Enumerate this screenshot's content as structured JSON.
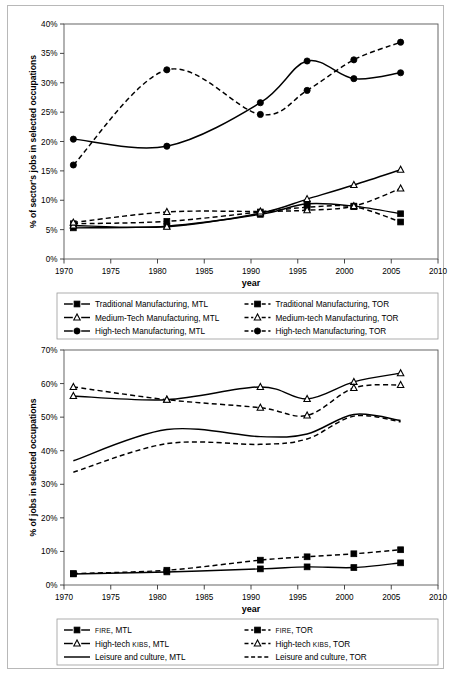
{
  "figure": {
    "background": "#ffffff",
    "border_color": "#b8b8b8"
  },
  "chart_data": [
    {
      "id": "manufacturing",
      "type": "line",
      "title": "",
      "xlabel": "year",
      "ylabel": "% of sector's jobs in selected occupations",
      "xlim": [
        1970,
        2010
      ],
      "ylim": [
        0,
        40
      ],
      "xticks": [
        "1970",
        "1975",
        "1980",
        "1985",
        "1990",
        "1995",
        "2000",
        "2005",
        "2010"
      ],
      "yticks": [
        "0%",
        "5%",
        "10%",
        "15%",
        "20%",
        "25%",
        "30%",
        "35%",
        "40%"
      ],
      "grid": false,
      "legend_position": "below",
      "x": [
        1971,
        1981,
        1991,
        1996,
        2001,
        2006
      ],
      "series": [
        {
          "name": "Traditional Manufacturing, MTL",
          "style": "solid",
          "marker": "square-filled",
          "values": [
            5.3,
            5.6,
            7.6,
            9.4,
            9.0,
            7.7
          ]
        },
        {
          "name": "Traditional Manufacturing, TOR",
          "style": "dashed",
          "marker": "square-filled",
          "values": [
            6.0,
            6.4,
            8.0,
            8.8,
            8.9,
            6.3
          ]
        },
        {
          "name": "Medium-Tech Manufacturing, MTL",
          "style": "solid",
          "marker": "triangle-open",
          "values": [
            5.7,
            5.5,
            7.8,
            10.2,
            12.6,
            15.2
          ]
        },
        {
          "name": "Medium-tech Manufacturing, TOR",
          "style": "dashed",
          "marker": "triangle-open",
          "values": [
            6.2,
            8.0,
            8.1,
            8.3,
            9.0,
            12.0
          ]
        },
        {
          "name": "High-tech Manufacturing, MTL",
          "style": "solid",
          "marker": "circle-filled",
          "values": [
            20.4,
            19.2,
            26.6,
            33.7,
            30.7,
            31.7
          ]
        },
        {
          "name": "High-tech Manufacturing, TOR",
          "style": "dashed",
          "marker": "circle-filled",
          "values": [
            16.0,
            32.2,
            24.6,
            28.7,
            33.9,
            36.9
          ]
        }
      ],
      "legend": [
        "Traditional Manufacturing, MTL",
        "Traditional Manufacturing, TOR",
        "Medium-Tech Manufacturing, MTL",
        "Medium-tech Manufacturing, TOR",
        "High-tech Manufacturing, MTL",
        "High-tech Manufacturing, TOR"
      ]
    },
    {
      "id": "services",
      "type": "line",
      "title": "",
      "xlabel": "year",
      "ylabel": "% of jobs in selected occupations",
      "xlim": [
        1970,
        2010
      ],
      "ylim": [
        0,
        70
      ],
      "xticks": [
        "1970",
        "1975",
        "1980",
        "1985",
        "1990",
        "1995",
        "2000",
        "2005",
        "2010"
      ],
      "yticks": [
        "0%",
        "10%",
        "20%",
        "30%",
        "40%",
        "50%",
        "60%",
        "70%"
      ],
      "grid": false,
      "legend_position": "below",
      "x": [
        1971,
        1981,
        1991,
        1996,
        2001,
        2006
      ],
      "series": [
        {
          "name": "FIRE, MTL",
          "style": "solid",
          "marker": "square-filled",
          "values": [
            3.3,
            3.9,
            4.8,
            5.4,
            5.2,
            6.6
          ]
        },
        {
          "name": "FIRE, TOR",
          "style": "dashed",
          "marker": "square-filled",
          "values": [
            3.4,
            4.4,
            7.4,
            8.4,
            9.3,
            10.5
          ]
        },
        {
          "name": "High-tech KIBS, MTL",
          "style": "solid",
          "marker": "triangle-open",
          "values": [
            56.3,
            55.2,
            59.0,
            55.4,
            60.5,
            63.1
          ]
        },
        {
          "name": "High-tech KIBS, TOR",
          "style": "dashed",
          "marker": "triangle-open",
          "values": [
            59.0,
            55.2,
            52.8,
            50.5,
            58.7,
            59.6
          ]
        },
        {
          "name": "Leisure and culture, MTL",
          "style": "solid",
          "marker": "none",
          "values": [
            37.0,
            46.3,
            44.2,
            45.0,
            50.8,
            49.0
          ]
        },
        {
          "name": "Leisure and culture, TOR",
          "style": "dashed",
          "marker": "none",
          "values": [
            33.6,
            42.1,
            41.9,
            43.5,
            50.3,
            48.6
          ]
        }
      ],
      "legend": [
        "FIRE, MTL",
        "FIRE, TOR",
        "High-tech KIBS, MTL",
        "High-tech KIBS, TOR",
        "Leisure and culture, MTL",
        "Leisure and culture, TOR"
      ]
    }
  ]
}
